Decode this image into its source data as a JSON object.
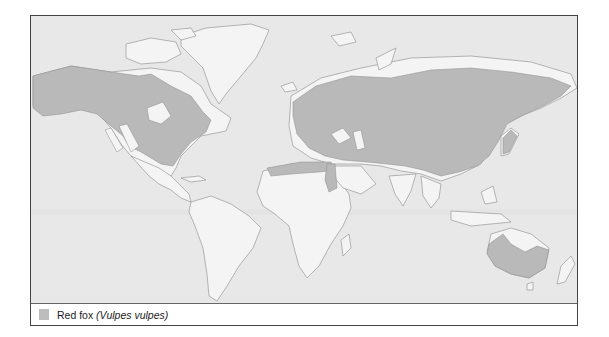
{
  "map": {
    "title": "Red fox distribution",
    "colors": {
      "ocean": "#e8e8e8",
      "land": "#f4f4f4",
      "range": "#b9b9b9",
      "coast": "#8a8a8a"
    }
  },
  "legend": {
    "items": [
      {
        "label": "Red fox",
        "scientific_name": "(Vulpes vulpes)",
        "swatch_color": "#bdbdbd"
      }
    ]
  }
}
